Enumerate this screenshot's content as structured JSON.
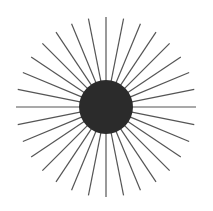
{
  "figure": {
    "type": "sunburst-illustration",
    "width": 213,
    "height": 211,
    "background": "#ffffff",
    "center": {
      "x": 106,
      "y": 107
    },
    "disc": {
      "radius": 27,
      "color": "#2b2b2b"
    },
    "rays": {
      "count": 32,
      "inner_radius": 20,
      "outer_radius": 90,
      "color": "#555555",
      "stroke_width": 1.2
    }
  }
}
